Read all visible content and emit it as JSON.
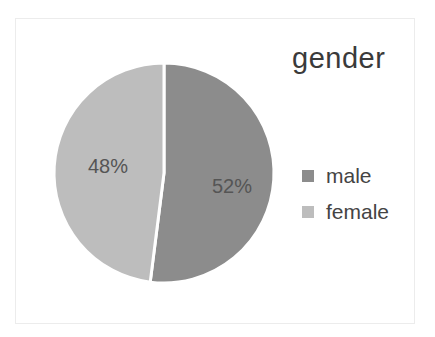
{
  "chart_data": {
    "type": "pie",
    "title": "gender",
    "categories": [
      "male",
      "female"
    ],
    "values": [
      52,
      48
    ],
    "labels": [
      "52%",
      "48%"
    ],
    "colors": [
      "#8c8c8c",
      "#bdbdbd"
    ],
    "legend_position": "right"
  },
  "title": "gender",
  "legend": [
    {
      "label": "male",
      "color": "#8c8c8c"
    },
    {
      "label": "female",
      "color": "#bdbdbd"
    }
  ],
  "data_labels": {
    "male": "52%",
    "female": "48%"
  }
}
